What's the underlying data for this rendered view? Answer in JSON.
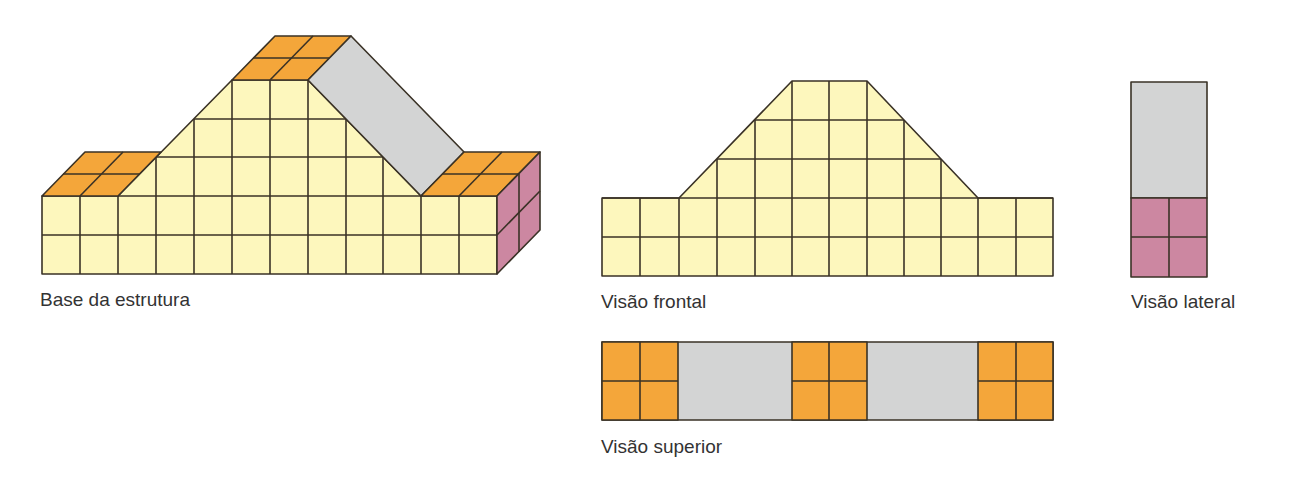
{
  "colors": {
    "front": "#fdf7bd",
    "top": "#f4a63a",
    "slope": "#d3d4d4",
    "side": "#cc87a1",
    "stroke": "#3a3226"
  },
  "views": {
    "base": {
      "label": "Base da estrutura"
    },
    "front": {
      "label": "Visão frontal"
    },
    "lateral": {
      "label": "Visão lateral"
    },
    "top": {
      "label": "Visão superior"
    }
  },
  "structure": {
    "columns": 12,
    "base_rows": 2,
    "peak_height_rows": 5,
    "depth_cells": 2
  }
}
